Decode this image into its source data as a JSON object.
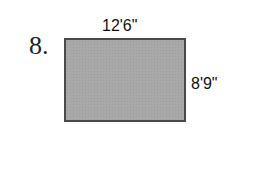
{
  "problem": {
    "number": "8.",
    "shape": "rectangle",
    "width_label": "12'6\"",
    "height_label": "8'9\"",
    "fill_color": "#a9a9a9",
    "border_color": "#4a4a4a"
  }
}
